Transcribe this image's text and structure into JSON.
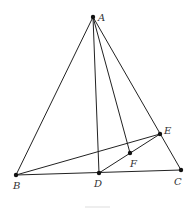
{
  "diagram": {
    "type": "geometry",
    "points": {
      "A": {
        "label": "A",
        "x": 93,
        "y": 17
      },
      "B": {
        "label": "B",
        "x": 16,
        "y": 175
      },
      "C": {
        "label": "C",
        "x": 181,
        "y": 170
      },
      "D": {
        "label": "D",
        "x": 99,
        "y": 173
      },
      "E": {
        "label": "E",
        "x": 160,
        "y": 134
      },
      "F": {
        "label": "F",
        "x": 130,
        "y": 153
      }
    },
    "segments": [
      "AB",
      "AC",
      "AD",
      "AF",
      "BC",
      "BE",
      "DE"
    ],
    "colors": {
      "stroke": "#222222",
      "point": "#111111",
      "label": "#333333"
    }
  }
}
